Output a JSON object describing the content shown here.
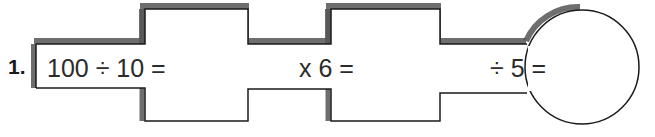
{
  "item": {
    "number_label": "1.",
    "type": "function-machine-chain"
  },
  "expressions": [
    {
      "id": "step-1",
      "text": "100 ÷ 10 ="
    },
    {
      "id": "step-2",
      "text": "x 6 ="
    },
    {
      "id": "step-3",
      "text": "÷ 5 ="
    }
  ],
  "colors": {
    "outline": "#1a1a1a",
    "shadow": "#5a5a5a",
    "fill": "#ffffff",
    "text": "#2b2b2b",
    "number": "#1a1a1a"
  },
  "geometry": {
    "outline_width": 1.4,
    "shadow_width": 5,
    "band_top": 44,
    "band_bottom": 88,
    "block_top": 8,
    "block_bottom": 121,
    "mid_top": 44,
    "mid_bottom": 89,
    "left_x": 35,
    "step1_x": 145,
    "step2_x": 248,
    "step3_x": 331,
    "step4_x": 440,
    "circle_cx": 582,
    "circle_cy": 67,
    "circle_r": 57
  }
}
